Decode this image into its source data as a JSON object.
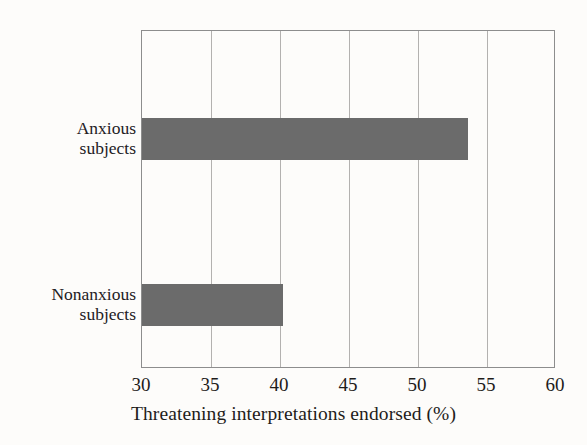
{
  "chart_data": {
    "type": "bar",
    "orientation": "horizontal",
    "title": "",
    "xlabel": "Threatening interpretations endorsed (%)",
    "ylabel": "",
    "categories": [
      "Anxious subjects",
      "Nonanxious subjects"
    ],
    "category_label_lines": [
      [
        "Anxious",
        "subjects"
      ],
      [
        "Nonanxious",
        "subjects"
      ]
    ],
    "values": [
      53.6,
      40.2
    ],
    "xlim": [
      30,
      60
    ],
    "xticks": [
      30,
      35,
      40,
      45,
      50,
      55,
      60
    ],
    "xtick_labels": [
      "30",
      "35",
      "40",
      "45",
      "50",
      "55",
      "60"
    ],
    "grid": "vertical",
    "legend": "none",
    "bar_color": "#6b6b6b",
    "frame_color": "#8d8d8d",
    "gridline_color": "#b3b1af",
    "background_color": "#fdfcfa"
  },
  "axis": {
    "title": "Threatening interpretations endorsed (%)",
    "ticks": [
      {
        "value": 30,
        "label": "30"
      },
      {
        "value": 35,
        "label": "35"
      },
      {
        "value": 40,
        "label": "40"
      },
      {
        "value": 45,
        "label": "45"
      },
      {
        "value": 50,
        "label": "50"
      },
      {
        "value": 55,
        "label": "55"
      },
      {
        "value": 60,
        "label": "60"
      }
    ]
  },
  "bars": [
    {
      "label_line1": "Anxious",
      "label_line2": "subjects",
      "value": 53.6
    },
    {
      "label_line1": "Nonanxious",
      "label_line2": "subjects",
      "value": 40.2
    }
  ]
}
